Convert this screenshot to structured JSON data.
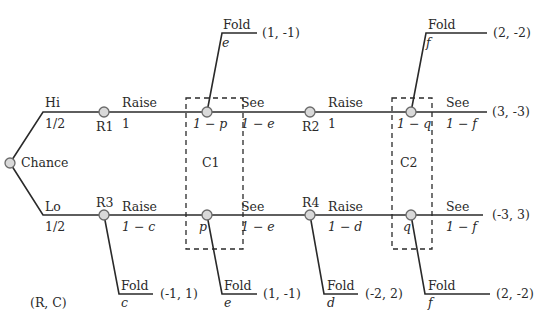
{
  "diagram": {
    "type": "game-tree",
    "legend": "(R, C)",
    "chance": {
      "label": "Chance"
    },
    "branches": {
      "hi": {
        "label": "Hi",
        "prob": "1/2"
      },
      "lo": {
        "label": "Lo",
        "prob": "1/2"
      }
    },
    "nodes": {
      "r1": "R1",
      "r2": "R2",
      "r3": "R3",
      "r4": "R4"
    },
    "info_sets": {
      "c1": "C1",
      "c2": "C2"
    },
    "top_row": {
      "r1_action": {
        "label": "Raise",
        "prob": "1"
      },
      "c1_prob": "1 − p",
      "c1_see": {
        "label": "See",
        "prob": "1 − e"
      },
      "c1_fold": {
        "label": "Fold",
        "prob": "e",
        "payoff": "(1, -1)"
      },
      "r2_action": {
        "label": "Raise",
        "prob": "1"
      },
      "c2_prob": "1 − q",
      "c2_see": {
        "label": "See",
        "prob": "1 − f",
        "payoff": "(3, -3)"
      },
      "c2_fold": {
        "label": "Fold",
        "prob": "f",
        "payoff": "(2, -2)"
      }
    },
    "bottom_row": {
      "r3_action": {
        "label": "Raise",
        "prob": "1 − c"
      },
      "r3_fold": {
        "label": "Fold",
        "prob": "c",
        "payoff": "(-1, 1)"
      },
      "c1_prob": "p",
      "c1_see": {
        "label": "See",
        "prob": "1 − e"
      },
      "c1_fold": {
        "label": "Fold",
        "prob": "e",
        "payoff": "(1, -1)"
      },
      "r4_action": {
        "label": "Raise",
        "prob": "1 − d"
      },
      "r4_fold": {
        "label": "Fold",
        "prob": "d",
        "payoff": "(-2, 2)"
      },
      "c2_prob": "q",
      "c2_see": {
        "label": "See",
        "prob": "1 − f",
        "payoff": "(-3, 3)"
      },
      "c2_fold": {
        "label": "Fold",
        "prob": "f",
        "payoff": "(2, -2)"
      }
    }
  }
}
